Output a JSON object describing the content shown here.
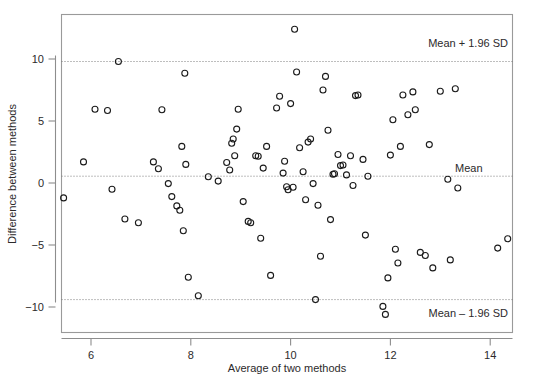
{
  "chart_data": {
    "type": "scatter",
    "title": "",
    "xlabel": "Average of two methods",
    "ylabel": "Difference between methods",
    "xlim": [
      5.25,
      14.75
    ],
    "ylim": [
      -11.6,
      13.2
    ],
    "xticks": [
      6,
      8,
      10,
      12,
      14
    ],
    "yticks": [
      10,
      5,
      0,
      -5,
      -10
    ],
    "grid": false,
    "legend": "none",
    "annotations": [
      {
        "name": "upper-limit-label",
        "text": "Mean + 1.96 SD",
        "y": 9.8,
        "x": 13.3
      },
      {
        "name": "mean-label",
        "text": "Mean",
        "y": 0.55,
        "x": 13.1
      },
      {
        "name": "lower-limit-label",
        "text": "Mean – 1.96 SD",
        "y": -9.4,
        "x": 13.3
      }
    ],
    "reference_lines": [
      {
        "name": "upper-limit-of-agreement",
        "label": "Mean + 1.96 SD",
        "value": 9.8,
        "style": "dotted"
      },
      {
        "name": "mean-bias",
        "label": "Mean",
        "value": 0.55,
        "style": "dotted"
      },
      {
        "name": "lower-limit-of-agreement",
        "label": "Mean – 1.96 SD",
        "value": -9.4,
        "style": "dotted"
      }
    ],
    "marker": {
      "shape": "open-circle",
      "radius": 3.0,
      "color": "#1a1a1a"
    },
    "points": [
      [
        5.45,
        -1.2
      ],
      [
        5.85,
        1.7
      ],
      [
        6.08,
        5.95
      ],
      [
        6.33,
        5.85
      ],
      [
        6.42,
        -0.5
      ],
      [
        6.55,
        9.8
      ],
      [
        6.68,
        -2.9
      ],
      [
        6.95,
        -3.2
      ],
      [
        7.25,
        1.7
      ],
      [
        7.35,
        1.15
      ],
      [
        7.42,
        5.9
      ],
      [
        7.55,
        -0.05
      ],
      [
        7.62,
        -1.1
      ],
      [
        7.72,
        -1.85
      ],
      [
        7.78,
        -2.2
      ],
      [
        7.82,
        2.95
      ],
      [
        7.85,
        -3.85
      ],
      [
        7.88,
        8.85
      ],
      [
        7.9,
        1.5
      ],
      [
        7.95,
        -7.6
      ],
      [
        8.15,
        -9.1
      ],
      [
        8.35,
        0.5
      ],
      [
        8.55,
        0.15
      ],
      [
        8.72,
        1.65
      ],
      [
        8.78,
        1.05
      ],
      [
        8.82,
        3.2
      ],
      [
        8.85,
        3.55
      ],
      [
        8.88,
        2.2
      ],
      [
        8.92,
        4.35
      ],
      [
        8.95,
        5.95
      ],
      [
        9.05,
        -1.5
      ],
      [
        9.15,
        -3.1
      ],
      [
        9.2,
        -3.2
      ],
      [
        9.3,
        2.2
      ],
      [
        9.35,
        2.15
      ],
      [
        9.4,
        -4.45
      ],
      [
        9.45,
        1.2
      ],
      [
        9.52,
        2.95
      ],
      [
        9.6,
        -7.45
      ],
      [
        9.72,
        6.05
      ],
      [
        9.78,
        7.0
      ],
      [
        9.85,
        0.8
      ],
      [
        9.88,
        1.75
      ],
      [
        9.92,
        -0.3
      ],
      [
        9.95,
        -0.55
      ],
      [
        10.0,
        6.4
      ],
      [
        10.05,
        -0.35
      ],
      [
        10.08,
        12.4
      ],
      [
        10.12,
        8.95
      ],
      [
        10.18,
        2.85
      ],
      [
        10.25,
        0.9
      ],
      [
        10.3,
        -1.35
      ],
      [
        10.35,
        3.3
      ],
      [
        10.4,
        3.55
      ],
      [
        10.45,
        -0.05
      ],
      [
        10.5,
        -9.4
      ],
      [
        10.55,
        -1.8
      ],
      [
        10.6,
        -5.9
      ],
      [
        10.65,
        7.5
      ],
      [
        10.7,
        8.6
      ],
      [
        10.75,
        4.25
      ],
      [
        10.8,
        -2.95
      ],
      [
        10.85,
        0.7
      ],
      [
        10.88,
        0.75
      ],
      [
        10.95,
        2.3
      ],
      [
        11.0,
        1.4
      ],
      [
        11.05,
        1.45
      ],
      [
        11.12,
        0.65
      ],
      [
        11.2,
        2.2
      ],
      [
        11.25,
        -0.2
      ],
      [
        11.3,
        7.05
      ],
      [
        11.35,
        7.1
      ],
      [
        11.45,
        1.9
      ],
      [
        11.5,
        -4.2
      ],
      [
        11.55,
        0.55
      ],
      [
        11.85,
        -9.95
      ],
      [
        11.9,
        -10.6
      ],
      [
        11.95,
        -7.65
      ],
      [
        12.0,
        2.25
      ],
      [
        12.05,
        5.1
      ],
      [
        12.1,
        -5.35
      ],
      [
        12.15,
        -6.45
      ],
      [
        12.2,
        2.95
      ],
      [
        12.25,
        7.1
      ],
      [
        12.35,
        5.5
      ],
      [
        12.45,
        7.35
      ],
      [
        12.5,
        5.9
      ],
      [
        12.6,
        -5.6
      ],
      [
        12.7,
        -5.85
      ],
      [
        12.78,
        3.1
      ],
      [
        12.85,
        -6.85
      ],
      [
        13.0,
        7.4
      ],
      [
        13.15,
        0.3
      ],
      [
        13.2,
        -6.2
      ],
      [
        13.3,
        7.6
      ],
      [
        13.35,
        -0.4
      ],
      [
        14.15,
        -5.25
      ],
      [
        14.35,
        -4.5
      ]
    ]
  },
  "axes": {
    "x_tick_labels": [
      "6",
      "8",
      "10",
      "12",
      "14"
    ],
    "y_tick_labels": [
      "10",
      "5",
      "0",
      "−5",
      "−10"
    ],
    "x_axis_title": "Average of two methods",
    "y_axis_title": "Difference between methods"
  },
  "labels": {
    "upper_limit": "Mean + 1.96 SD",
    "mean": "Mean",
    "lower_limit": "Mean – 1.96 SD"
  }
}
